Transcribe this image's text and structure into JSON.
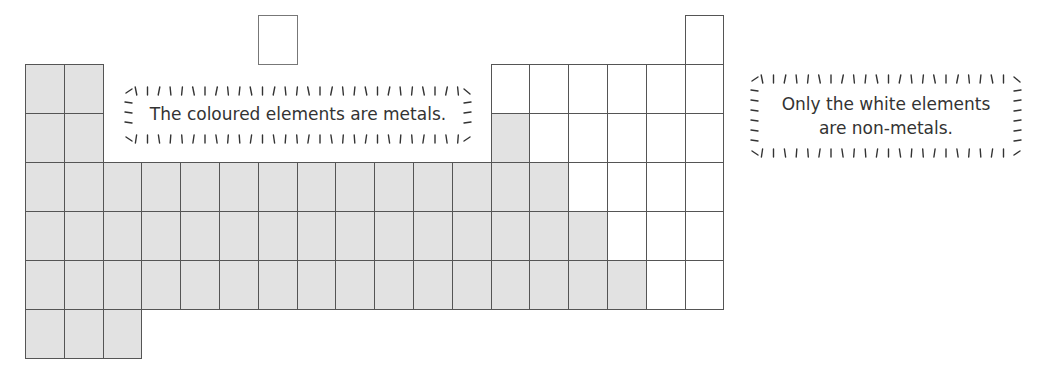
{
  "diagram": {
    "type": "periodic-table-metals",
    "grid": {
      "left": 25,
      "top": 64,
      "cell_w": 38.8,
      "cell_h": 49,
      "columns": 18
    },
    "colors": {
      "metal": "#e2e2e2",
      "nonmetal": "#ffffff",
      "border": "#555555"
    },
    "top_cells": [
      {
        "col": 7,
        "y": 15,
        "kind": "nonmetal",
        "light": true
      },
      {
        "col": 18,
        "y": 15,
        "kind": "nonmetal"
      }
    ],
    "rows": [
      {
        "metal": [
          1,
          2
        ],
        "nonmetal": [
          13,
          14,
          15,
          16,
          17,
          18
        ]
      },
      {
        "metal": [
          1,
          2,
          13
        ],
        "nonmetal": [
          14,
          15,
          16,
          17,
          18
        ]
      },
      {
        "metal": [
          1,
          2,
          3,
          4,
          5,
          6,
          7,
          8,
          9,
          10,
          11,
          12,
          13,
          14
        ],
        "nonmetal": [
          15,
          16,
          17,
          18
        ]
      },
      {
        "metal": [
          1,
          2,
          3,
          4,
          5,
          6,
          7,
          8,
          9,
          10,
          11,
          12,
          13,
          14,
          15
        ],
        "nonmetal": [
          16,
          17,
          18
        ]
      },
      {
        "metal": [
          1,
          2,
          3,
          4,
          5,
          6,
          7,
          8,
          9,
          10,
          11,
          12,
          13,
          14,
          15,
          16
        ],
        "nonmetal": [
          17,
          18
        ]
      },
      {
        "metal": [
          1,
          2,
          3
        ],
        "nonmetal": []
      }
    ]
  },
  "callouts": {
    "metals": {
      "line1": "The coloured elements are metals."
    },
    "nonmetals": {
      "line1": "Only the white elements",
      "line2": "are non-metals."
    }
  }
}
